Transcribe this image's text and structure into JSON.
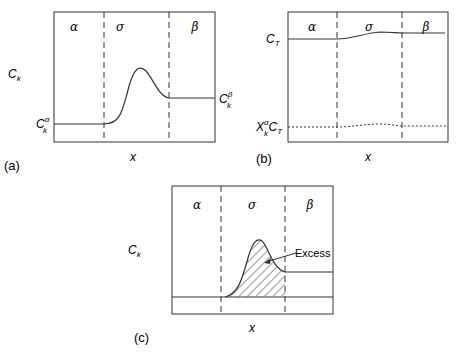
{
  "panels": {
    "a": {
      "tag": "(a)",
      "regions": [
        "α",
        "σ",
        "β"
      ],
      "ylabel": "C",
      "ylabel_sub": "k",
      "xlabel": "x",
      "left_label": "C",
      "left_sub": "k",
      "left_sup": "α",
      "right_label": "C",
      "right_sub": "k",
      "right_sup": "β"
    },
    "b": {
      "tag": "(b)",
      "regions": [
        "α",
        "σ",
        "β"
      ],
      "top_label": "C",
      "top_sub": "T",
      "bottom_label_X": "X",
      "bottom_label_sub": "k",
      "bottom_label_sup": "α",
      "bottom_label_C": "C",
      "bottom_label_Csub": "T",
      "xlabel": "x"
    },
    "c": {
      "tag": "(c)",
      "regions": [
        "α",
        "σ",
        "β"
      ],
      "ylabel": "C",
      "ylabel_sub": "k",
      "xlabel": "x",
      "annotation": "Excess"
    }
  },
  "colors": {
    "line": "#333333",
    "background": "#ffffff"
  }
}
